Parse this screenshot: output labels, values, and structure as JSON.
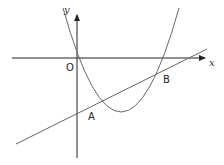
{
  "diagram": {
    "type": "coordinate-graph",
    "axes": {
      "x_label": "x",
      "y_label": "y",
      "origin_label": "O"
    },
    "points": [
      {
        "label": "A",
        "description": "intersection of line and parabola, below x-axis, left of vertex"
      },
      {
        "label": "B",
        "description": "intersection of line and parabola, right side near x-axis"
      }
    ],
    "curves": [
      {
        "kind": "parabola",
        "opens": "up",
        "passes_through_origin": true
      },
      {
        "kind": "line",
        "slope": "positive"
      }
    ],
    "colors": {
      "axes": "#222222",
      "curves": "#555555",
      "labels": "#222222"
    }
  }
}
